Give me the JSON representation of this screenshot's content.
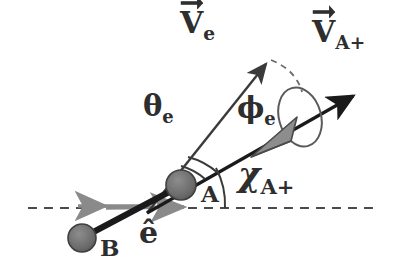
{
  "figure": {
    "background_color": "#ffffff",
    "ink_color": "#2e2e2e",
    "black_color": "#1a1a1a",
    "gray_color": "#8a8a8a",
    "ball_fill": "#6e6e6e"
  },
  "labels": {
    "v_e": {
      "base": "V",
      "sub": "e",
      "vector": true,
      "name": "electron-velocity-vector-label"
    },
    "v_aplus": {
      "base": "V",
      "sub": "A+",
      "vector": true,
      "name": "ion-velocity-vector-label"
    },
    "theta_e": {
      "base": "θ",
      "sub": "e",
      "vector": false,
      "name": "polar-angle-label"
    },
    "phi_e": {
      "base": "ϕ",
      "sub": "e",
      "vector": false,
      "name": "azimuthal-angle-label"
    },
    "chi_aplus": {
      "base": "χ",
      "sub": "A+",
      "vector": false,
      "name": "scattering-angle-label"
    },
    "e_hat": {
      "base": "ê",
      "sub": "",
      "vector": false,
      "name": "unit-vector-label"
    },
    "atom_a": {
      "base": "A",
      "sub": "",
      "vector": false,
      "name": "atom-a-label"
    },
    "atom_b": {
      "base": "B",
      "sub": "",
      "vector": false,
      "name": "atom-b-label"
    }
  },
  "geometry": {
    "horizontal_axis": {
      "y": 208,
      "x_start": 28,
      "x_end": 376,
      "style": "dashed"
    },
    "ball_a": {
      "cx": 181,
      "cy": 185,
      "r": 15
    },
    "ball_b": {
      "cx": 82,
      "cy": 238,
      "r": 14
    },
    "internuclear_line": {
      "x1": 82,
      "y1": 238,
      "x2": 185,
      "y2": 184
    },
    "v_e_arrow": {
      "x1": 147,
      "y1": 213,
      "x2": 272,
      "y2": 57
    },
    "v_aplus_arrow": {
      "x1": 147,
      "y1": 213,
      "x2": 361,
      "y2": 92
    },
    "e_hat_arrow": {
      "x1": 106,
      "y1": 208,
      "x2": 191,
      "y2": 207
    },
    "left_arrow": {
      "x1": 141,
      "y1": 206,
      "x2": 71,
      "y2": 206
    },
    "cone": {
      "apex_x": 258,
      "apex_y": 152,
      "tip_x": 296,
      "tip_y": 122
    },
    "ellipse": {
      "cx": 300,
      "cy": 117,
      "rx": 22,
      "ry": 30,
      "rotation": -18
    },
    "dashed_arc": {
      "from_x": 272,
      "from_y": 60,
      "to_x": 300,
      "to_y": 92
    },
    "theta_arc_radius": 72,
    "phi_arc_radius": 60,
    "chi_arc_radius": 78
  }
}
